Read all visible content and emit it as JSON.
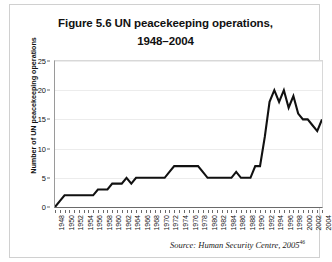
{
  "figure": {
    "title_line1": "Figure 5.6 UN peacekeeping operations,",
    "title_line2": "1948–2004",
    "source_text": "Source: Human Security Centre, 2005",
    "source_superscript": "46",
    "line_color": "#111111",
    "grid_color": "#ececec",
    "background_color": "#ffffff"
  },
  "chart_data": {
    "type": "line",
    "title": "Figure 5.6 UN peacekeeping operations, 1948–2004",
    "xlabel": "",
    "ylabel": "Number of UN peacekeeping operations",
    "ylim": [
      0,
      25
    ],
    "xlim": [
      1948,
      2004
    ],
    "yticks": [
      0,
      5,
      10,
      15,
      20,
      25
    ],
    "xticks": [
      1948,
      1950,
      1952,
      1954,
      1956,
      1958,
      1960,
      1962,
      1964,
      1966,
      1968,
      1970,
      1972,
      1974,
      1976,
      1978,
      1980,
      1982,
      1984,
      1986,
      1988,
      1990,
      1992,
      1994,
      1996,
      1998,
      2000,
      2002,
      2004
    ],
    "grid": true,
    "legend": false,
    "x": [
      1948,
      1949,
      1950,
      1951,
      1952,
      1953,
      1954,
      1955,
      1956,
      1957,
      1958,
      1959,
      1960,
      1961,
      1962,
      1963,
      1964,
      1965,
      1966,
      1967,
      1968,
      1969,
      1970,
      1971,
      1972,
      1973,
      1974,
      1975,
      1976,
      1977,
      1978,
      1979,
      1980,
      1981,
      1982,
      1983,
      1984,
      1985,
      1986,
      1987,
      1988,
      1989,
      1990,
      1991,
      1992,
      1993,
      1994,
      1995,
      1996,
      1997,
      1998,
      1999,
      2000,
      2001,
      2002,
      2003,
      2004
    ],
    "values": [
      0,
      1,
      2,
      2,
      2,
      2,
      2,
      2,
      2,
      3,
      3,
      3,
      4,
      4,
      4,
      5,
      4,
      5,
      5,
      5,
      5,
      5,
      5,
      5,
      6,
      7,
      7,
      7,
      7,
      7,
      7,
      6,
      5,
      5,
      5,
      5,
      5,
      5,
      6,
      5,
      5,
      5,
      7,
      7,
      12,
      18,
      20,
      18,
      20,
      17,
      19,
      16,
      15,
      15,
      14,
      13,
      15
    ],
    "series_name": "UN peacekeeping operations"
  }
}
